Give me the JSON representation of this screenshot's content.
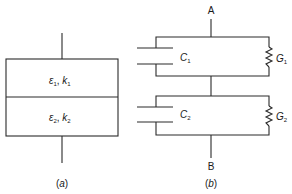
{
  "figure": {
    "panel_a": {
      "caption": "(a)",
      "layer1": {
        "eps": "ε",
        "eps_sub": "1",
        "k": "k",
        "k_sub": "1"
      },
      "layer2": {
        "eps": "ε",
        "eps_sub": "2",
        "k": "k",
        "k_sub": "2"
      }
    },
    "panel_b": {
      "caption": "(b)",
      "node_top": "A",
      "node_bottom": "B",
      "c1": {
        "name": "C",
        "sub": "1"
      },
      "g1": {
        "name": "G",
        "sub": "1"
      },
      "c2": {
        "name": "C",
        "sub": "2"
      },
      "g2": {
        "name": "G",
        "sub": "2"
      }
    },
    "stroke_color": "#2a2a2a"
  }
}
